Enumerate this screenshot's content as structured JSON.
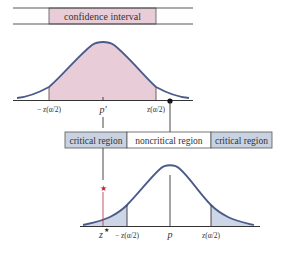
{
  "top": {
    "band_label": "confidence interval",
    "axis_labels": {
      "left": "− z(α/2)",
      "center": "p′",
      "right": "z(α/2)"
    }
  },
  "bottom": {
    "band_labels": {
      "left": "critical region",
      "middle": "noncritical region",
      "right": "critical region"
    },
    "axis_labels": {
      "zstar": "z",
      "zstar_sup": "★",
      "left": "− z(α/2)",
      "center": "p",
      "right": "z(α/2)"
    },
    "star_marker": "★"
  },
  "colors": {
    "curve": "#4a5a8a",
    "confidence_fill": "#e8cdd8",
    "critical_fill": "#ccd6e6",
    "critical_band": "#c9d2e0",
    "star": "#c0283c",
    "line": "#333333"
  }
}
